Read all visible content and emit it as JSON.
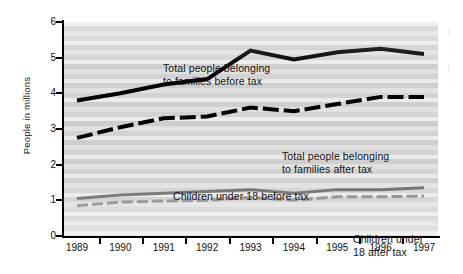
{
  "chart_data": {
    "type": "line",
    "title": "",
    "xlabel": "",
    "ylabel": "People in millions",
    "categories": [
      1989,
      1990,
      1991,
      1992,
      1993,
      1994,
      1995,
      1996,
      1997
    ],
    "xlim": [
      1989,
      1997
    ],
    "ylim": [
      0,
      6
    ],
    "yticks": [
      0,
      1,
      2,
      3,
      4,
      5,
      6
    ],
    "grid": false,
    "legend_position": "inline-annotations",
    "series": [
      {
        "name": "Total people belonging to families before tax",
        "style": "solid",
        "color": "#000000",
        "width": 4,
        "values": [
          3.8,
          4.0,
          4.25,
          4.4,
          5.2,
          4.95,
          5.15,
          5.25,
          5.1
        ]
      },
      {
        "name": "Total people belonging to families after tax",
        "style": "dashed",
        "color": "#000000",
        "width": 4,
        "values": [
          2.75,
          3.05,
          3.3,
          3.35,
          3.6,
          3.5,
          3.7,
          3.9,
          3.9
        ]
      },
      {
        "name": "Children under 18 before tax",
        "style": "solid",
        "color": "#6b6b6b",
        "width": 3,
        "values": [
          1.05,
          1.15,
          1.2,
          1.25,
          1.3,
          1.2,
          1.3,
          1.3,
          1.35
        ]
      },
      {
        "name": "Children under 18 after tax",
        "style": "dashed",
        "color": "#8a8a8a",
        "width": 3,
        "values": [
          0.85,
          0.95,
          0.98,
          1.0,
          1.08,
          1.0,
          1.1,
          1.1,
          1.12
        ]
      }
    ],
    "annotations": [
      {
        "id": "before_tax",
        "text": "Total people belonging\nto families before tax"
      },
      {
        "id": "after_tax",
        "text": "Total people belonging\nto families after tax"
      },
      {
        "id": "children_before_tax",
        "text": "Children under 18 before tax"
      },
      {
        "id": "children_after_tax",
        "text": "Children under 18 after tax"
      }
    ]
  },
  "axis": {
    "y_title": "People in millions",
    "y_tick_labels": [
      "6",
      "5",
      "4",
      "3",
      "2",
      "1",
      "0"
    ],
    "x_tick_labels": [
      "1989",
      "1990",
      "1991",
      "1992",
      "1993",
      "1994",
      "1995",
      "1996",
      "1997"
    ]
  }
}
